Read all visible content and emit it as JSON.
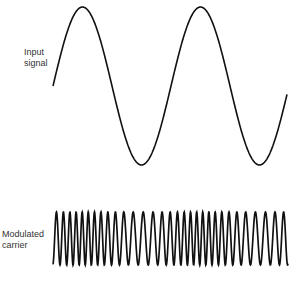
{
  "labels": {
    "input_line1": "Input",
    "input_line2": "signal",
    "carrier_line1": "Modulated",
    "carrier_line2": "carrier"
  },
  "colors": {
    "stroke": "#111111",
    "text": "#333333",
    "background": "#ffffff"
  },
  "input_signal": {
    "x_start": 53,
    "x_end": 287,
    "mid_y": 86,
    "amplitude": 79,
    "period_px": 118
  },
  "carrier": {
    "x_start": 53,
    "x_end": 288,
    "top_y": 212,
    "bottom_y": 265,
    "base_freq": 0.1,
    "deviation": 0.55
  }
}
